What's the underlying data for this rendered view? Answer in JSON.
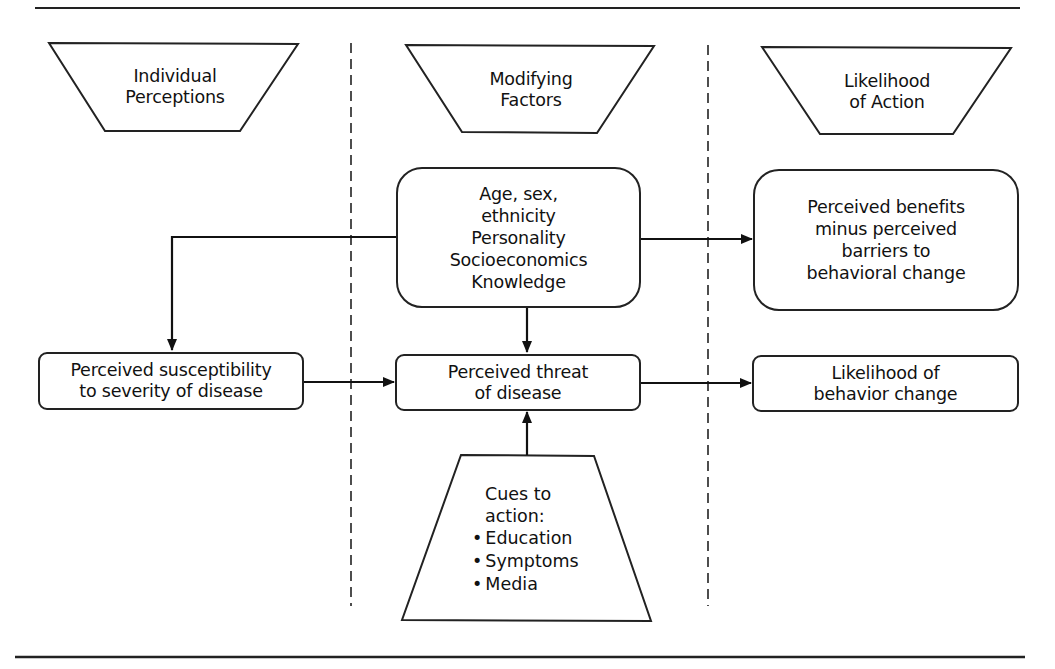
{
  "diagram": {
    "type": "flow-model",
    "columns": [
      {
        "id": "individual",
        "header": "Individual\nPerceptions"
      },
      {
        "id": "modifying",
        "header": "Modifying\nFactors"
      },
      {
        "id": "likelihood",
        "header": "Likelihood\nof Action"
      }
    ],
    "nodes": {
      "demographics": "Age, sex,\nethnicity\nPersonality\nSocioeconomics\nKnowledge",
      "benefits": "Perceived benefits\nminus perceived\nbarriers to\nbehavioral change",
      "susceptibility": "Perceived susceptibility\nto severity of disease",
      "threat": "Perceived threat\nof disease",
      "behavior_change": "Likelihood of\nbehavior change",
      "cues": {
        "title": "Cues to\naction:",
        "items": [
          "Education",
          "Symptoms",
          "Media"
        ]
      }
    },
    "edges": [
      {
        "from": "demographics",
        "to": "susceptibility"
      },
      {
        "from": "demographics",
        "to": "benefits"
      },
      {
        "from": "demographics",
        "to": "threat"
      },
      {
        "from": "susceptibility",
        "to": "threat"
      },
      {
        "from": "threat",
        "to": "behavior_change"
      },
      {
        "from": "cues",
        "to": "threat"
      }
    ],
    "colors": {
      "stroke": "#222222",
      "background": "#ffffff",
      "text": "#111111"
    }
  }
}
